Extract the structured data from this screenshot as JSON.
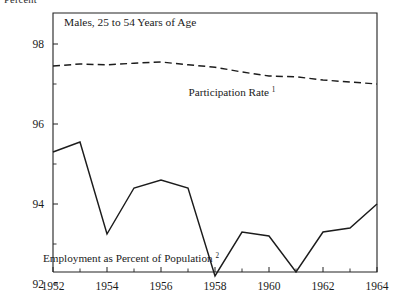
{
  "page": {
    "clipped_top_text": "Percent"
  },
  "chart_data": {
    "type": "line",
    "title": "Males, 25 to 54 Years of Age",
    "xlabel": "",
    "ylabel": "Percent",
    "xlim": [
      1952,
      1964
    ],
    "ylim": [
      91.4,
      98.6
    ],
    "grid": false,
    "legend_position": "inline-annotation",
    "x": [
      1952,
      1953,
      1954,
      1955,
      1956,
      1957,
      1958,
      1959,
      1960,
      1961,
      1962,
      1963,
      1964
    ],
    "xticks_major": [
      1952,
      1954,
      1956,
      1958,
      1960,
      1962,
      1964
    ],
    "xticks_minor": [
      1953,
      1955,
      1957,
      1959,
      1961,
      1963
    ],
    "yticks_major": [
      92,
      94,
      96,
      98
    ],
    "yticks_minor": [
      93,
      95,
      97
    ],
    "series": [
      {
        "name": "Participation Rate",
        "footnote": "1",
        "style": "dashed",
        "annotation": "Participation Rate",
        "values": [
          97.45,
          97.5,
          97.48,
          97.52,
          97.55,
          97.48,
          97.42,
          97.3,
          97.2,
          97.18,
          97.1,
          97.05,
          97.0
        ]
      },
      {
        "name": "Employment as Percent of Population",
        "footnote": "2",
        "style": "solid",
        "annotation": "Employment as Percent of Population",
        "values": [
          95.3,
          95.55,
          93.25,
          94.4,
          94.6,
          94.4,
          92.2,
          93.3,
          93.2,
          92.3,
          93.3,
          93.4,
          94.0
        ]
      }
    ],
    "annotations": [
      {
        "text": "Participation Rate",
        "sup": "1",
        "x": 232,
        "y": 96
      },
      {
        "text": "Employment as Percent of Population",
        "sup": "2",
        "x": 131,
        "y": 262
      }
    ]
  }
}
